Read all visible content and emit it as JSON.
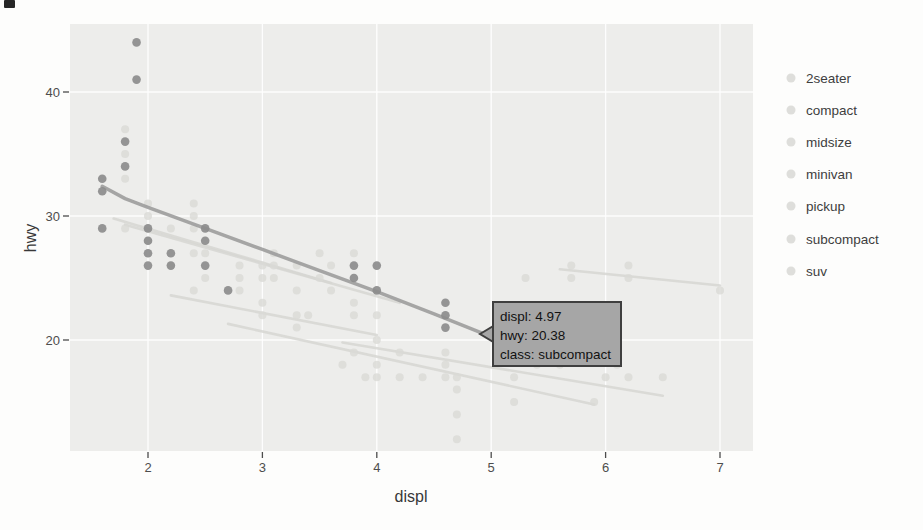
{
  "page": {
    "background": "#fdfdfc",
    "scan_artifact": true
  },
  "colors": {
    "panel_bg": "#ededeb",
    "gridline": "#ffffff",
    "highlight_point": "#8c8c8c",
    "highlight_line": "#9c9c9c",
    "dimmed_point": "#d9d9d6",
    "dimmed_line": "#d6d6d2",
    "tick_text": "#4d4d4d",
    "axis_title_text": "#383838",
    "legend_text": "#3e3e3e",
    "legend_key": "#d8d8d5",
    "tooltip_bg": "#a6a6a6",
    "tooltip_border": "#3f3f3f",
    "tooltip_text": "#121212"
  },
  "axes": {
    "x_title": "displ",
    "y_title": "hwy",
    "x_tick_labels": [
      "2",
      "3",
      "4",
      "5",
      "6",
      "7"
    ],
    "y_tick_labels": [
      "20",
      "30",
      "40"
    ]
  },
  "legend": {
    "items": [
      {
        "label": "2seater"
      },
      {
        "label": "compact"
      },
      {
        "label": "midsize"
      },
      {
        "label": "minivan"
      },
      {
        "label": "pickup"
      },
      {
        "label": "subcompact"
      },
      {
        "label": "suv"
      }
    ]
  },
  "tooltip": {
    "line1": "displ: 4.97",
    "line2": "hwy: 20.38",
    "line3": "class: subcompact"
  },
  "chart_data": {
    "type": "scatter",
    "title": "",
    "xlabel": "displ",
    "ylabel": "hwy",
    "xlim": [
      1.32,
      7.29
    ],
    "ylim": [
      11,
      45.5
    ],
    "x_ticks": [
      2,
      3,
      4,
      5,
      6,
      7
    ],
    "y_ticks": [
      20,
      30,
      40
    ],
    "grid": "white major gridlines on light gray panel (ggplot style)",
    "legend_position": "right",
    "classes": [
      "2seater",
      "compact",
      "midsize",
      "minivan",
      "pickup",
      "subcompact",
      "suv"
    ],
    "highlighted_class": "subcompact",
    "series": [
      {
        "name": "subcompact",
        "role": "highlighted",
        "points": [
          [
            1.6,
            33
          ],
          [
            1.6,
            32
          ],
          [
            1.6,
            29
          ],
          [
            1.8,
            36
          ],
          [
            1.8,
            34
          ],
          [
            1.9,
            44
          ],
          [
            1.9,
            41
          ],
          [
            2.0,
            29
          ],
          [
            2.0,
            28
          ],
          [
            2.0,
            27
          ],
          [
            2.0,
            26
          ],
          [
            2.2,
            27
          ],
          [
            2.2,
            26
          ],
          [
            2.5,
            29
          ],
          [
            2.5,
            28
          ],
          [
            2.5,
            26
          ],
          [
            2.7,
            24
          ],
          [
            3.8,
            26
          ],
          [
            3.8,
            25
          ],
          [
            4.0,
            26
          ],
          [
            4.0,
            24
          ],
          [
            4.6,
            23
          ],
          [
            4.6,
            22
          ],
          [
            4.6,
            21
          ]
        ]
      },
      {
        "name": "other-classes-dimmed",
        "role": "dimmed",
        "points": [
          [
            1.8,
            37
          ],
          [
            1.8,
            35
          ],
          [
            1.8,
            33
          ],
          [
            1.8,
            29
          ],
          [
            2.0,
            31
          ],
          [
            2.0,
            30
          ],
          [
            2.0,
            28
          ],
          [
            2.2,
            29
          ],
          [
            2.2,
            26
          ],
          [
            2.4,
            31
          ],
          [
            2.4,
            30
          ],
          [
            2.4,
            29
          ],
          [
            2.4,
            27
          ],
          [
            2.4,
            24
          ],
          [
            2.5,
            27
          ],
          [
            2.5,
            25
          ],
          [
            2.8,
            26
          ],
          [
            2.8,
            25
          ],
          [
            2.8,
            24
          ],
          [
            3.0,
            26
          ],
          [
            3.0,
            25
          ],
          [
            3.0,
            23
          ],
          [
            3.0,
            22
          ],
          [
            3.1,
            27
          ],
          [
            3.1,
            26
          ],
          [
            3.1,
            25
          ],
          [
            3.3,
            26
          ],
          [
            3.3,
            24
          ],
          [
            3.3,
            22
          ],
          [
            3.3,
            21
          ],
          [
            3.4,
            22
          ],
          [
            3.5,
            27
          ],
          [
            3.5,
            25
          ],
          [
            3.6,
            26
          ],
          [
            3.6,
            24
          ],
          [
            3.7,
            18
          ],
          [
            3.8,
            27
          ],
          [
            3.8,
            23
          ],
          [
            3.8,
            22
          ],
          [
            3.8,
            19
          ],
          [
            3.9,
            17
          ],
          [
            4.0,
            22
          ],
          [
            4.0,
            20
          ],
          [
            4.0,
            18
          ],
          [
            4.0,
            17
          ],
          [
            4.2,
            19
          ],
          [
            4.2,
            17
          ],
          [
            4.4,
            17
          ],
          [
            4.6,
            19
          ],
          [
            4.6,
            18
          ],
          [
            4.6,
            17
          ],
          [
            4.7,
            17
          ],
          [
            4.7,
            16
          ],
          [
            4.7,
            14
          ],
          [
            4.7,
            12
          ],
          [
            5.2,
            17
          ],
          [
            5.2,
            15
          ],
          [
            5.3,
            25
          ],
          [
            5.3,
            20
          ],
          [
            5.3,
            19
          ],
          [
            5.4,
            18
          ],
          [
            5.6,
            18
          ],
          [
            5.7,
            26
          ],
          [
            5.7,
            25
          ],
          [
            5.7,
            19
          ],
          [
            5.9,
            15
          ],
          [
            6.0,
            17
          ],
          [
            6.1,
            18
          ],
          [
            6.2,
            26
          ],
          [
            6.2,
            25
          ],
          [
            6.2,
            17
          ],
          [
            6.5,
            17
          ],
          [
            7.0,
            24
          ]
        ]
      }
    ],
    "smooth_lines": [
      {
        "name": "subcompact-smooth",
        "role": "highlighted",
        "points": [
          [
            1.6,
            32.4
          ],
          [
            1.8,
            31.4
          ],
          [
            2.0,
            30.7
          ],
          [
            2.5,
            29.0
          ],
          [
            3.0,
            27.3
          ],
          [
            3.5,
            25.6
          ],
          [
            4.0,
            23.9
          ],
          [
            4.5,
            22.1
          ],
          [
            4.97,
            20.38
          ]
        ]
      },
      {
        "name": "2seater-smooth",
        "role": "dimmed",
        "points": [
          [
            5.6,
            25.7
          ],
          [
            7.0,
            24.4
          ]
        ]
      },
      {
        "name": "compact-smooth",
        "role": "dimmed",
        "points": [
          [
            1.7,
            29.8
          ],
          [
            3.6,
            24.6
          ]
        ]
      },
      {
        "name": "midsize-smooth",
        "role": "dimmed",
        "points": [
          [
            1.8,
            29.3
          ],
          [
            4.2,
            23.0
          ]
        ]
      },
      {
        "name": "minivan-smooth",
        "role": "dimmed",
        "points": [
          [
            2.2,
            23.6
          ],
          [
            4.0,
            20.4
          ]
        ]
      },
      {
        "name": "pickup-smooth",
        "role": "dimmed",
        "points": [
          [
            2.7,
            21.3
          ],
          [
            5.9,
            14.8
          ]
        ]
      },
      {
        "name": "suv-smooth",
        "role": "dimmed",
        "points": [
          [
            3.7,
            19.8
          ],
          [
            6.5,
            15.5
          ]
        ]
      }
    ],
    "tooltip": {
      "lines": [
        "displ: 4.97",
        "hwy: 20.38",
        "class: subcompact"
      ],
      "anchor": {
        "displ": 4.97,
        "hwy": 20.38
      }
    }
  }
}
